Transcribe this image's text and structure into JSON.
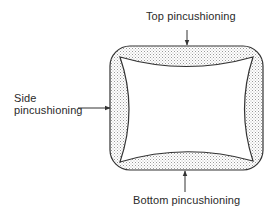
{
  "diagram": {
    "labels": {
      "top": "Top pincushioning",
      "side_line1": "Side",
      "side_line2": "pincushioning",
      "bottom": "Bottom pincushioning"
    },
    "colors": {
      "stroke": "#333333",
      "stipple": "#9a9a9a",
      "background": "#ffffff"
    }
  }
}
